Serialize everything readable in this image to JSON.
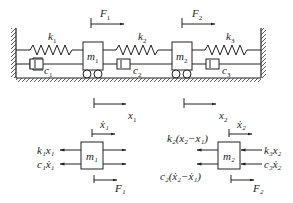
{
  "diagram": {
    "type": "two-degree-of-freedom spring-mass-damper system with free-body diagrams",
    "system": {
      "springs": [
        "k1",
        "k2",
        "k3"
      ],
      "dampers": [
        "c1",
        "c2",
        "c3"
      ],
      "masses": [
        "m1",
        "m2"
      ],
      "forces": [
        "F1",
        "F2"
      ]
    },
    "labels": {
      "F1": "F",
      "F1_sub": "1",
      "F2": "F",
      "F2_sub": "2",
      "k1": "k",
      "k1_sub": "1",
      "k2": "k",
      "k2_sub": "2",
      "k3": "k",
      "k3_sub": "3",
      "c1": "c",
      "c1_sub": "1",
      "c2": "c",
      "c2_sub": "2",
      "c3": "c",
      "c3_sub": "3",
      "m1": "m",
      "m1_sub": "1",
      "m2": "m",
      "m2_sub": "2",
      "x1": "x",
      "x1_sub": "1",
      "x2": "x",
      "x2_sub": "2"
    },
    "fbd1": {
      "mass": "m₁",
      "velocity": "ẋ₁",
      "left_forces": [
        "k₁x₁",
        "c₁ẋ₁"
      ],
      "force": "F₁"
    },
    "fbd2": {
      "mass": "m₂",
      "velocity": "ẋ₂",
      "left_forces": [
        "k₂(x₂−x₁)",
        "c₂(ẋ₂−ẋ₁)"
      ],
      "right_forces": [
        "k₃x₂",
        "c₃ẋ₂"
      ],
      "force": "F₂"
    }
  }
}
